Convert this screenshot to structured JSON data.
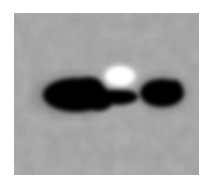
{
  "image": {
    "description": "Grayscale micrograph-like image: dark elongated dumbbell-shaped blob with a bright white spot above its center on a mottled gray background",
    "colors": {
      "page_background": "#ffffff",
      "frame_background": "#a3a3a3",
      "blob": "#050505",
      "highlight": "#ffffff"
    }
  }
}
